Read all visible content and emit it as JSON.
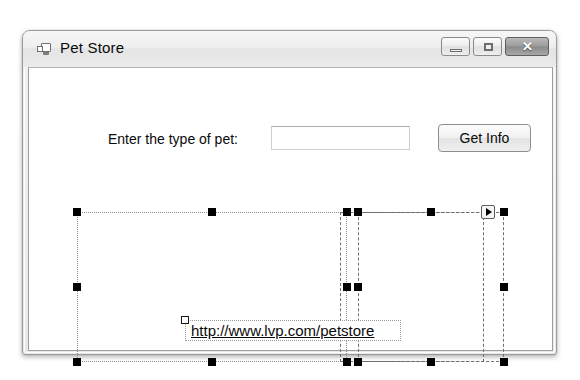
{
  "window": {
    "title": "Pet Store",
    "icon": "form-designer-icon",
    "caption_buttons": [
      {
        "name": "minimize",
        "glyph": "–"
      },
      {
        "name": "maximize",
        "glyph": "□"
      },
      {
        "name": "close",
        "glyph": "✕"
      }
    ]
  },
  "form": {
    "label_pet": "Enter the type of pet:",
    "textbox_value": "",
    "textbox_placeholder": "",
    "button_getinfo": "Get Info",
    "link_label": "http://www.lvp.com/petstore"
  },
  "designer": {
    "selection_handle_color": "#000000",
    "secondary_handle_color": "#ffffff",
    "smart_tag_glyph": "▶"
  }
}
